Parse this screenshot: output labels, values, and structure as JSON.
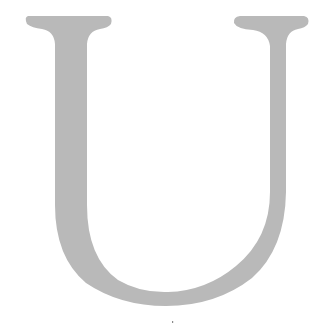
{
  "glyph": {
    "character": "U",
    "style": "serif capital letter",
    "fill_color": "#b9b9b9",
    "background_color": "#ffffff"
  },
  "marks": {
    "dot": {
      "x": 172,
      "y": 322,
      "color": "#8a8a8a"
    }
  }
}
